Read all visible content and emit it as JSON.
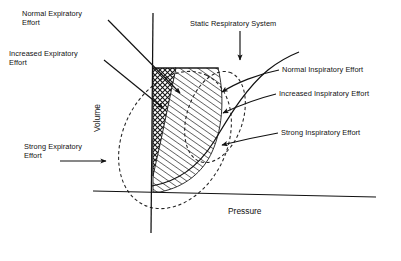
{
  "figure": {
    "axes": {
      "x_label": "Pressure",
      "y_label": "Volume",
      "x_label_pos": {
        "x": 228,
        "y": 206
      },
      "y_label_pos": {
        "x": 92,
        "y": 130
      },
      "origin": {
        "x": 152,
        "y": 193
      },
      "x_axis_start": {
        "x": 93,
        "y": 191
      },
      "x_axis_end": {
        "x": 376,
        "y": 197
      },
      "y_axis_top": {
        "x": 153,
        "y": 13
      },
      "y_axis_bottom": {
        "x": 151,
        "y": 233
      }
    },
    "annotations": [
      {
        "id": "normal-expiratory-effort",
        "label": "Normal Expiratory\nEffort",
        "line1": "Normal Expiratory",
        "line2": "Effort",
        "text_pos": {
          "x": 22,
          "y": 9
        },
        "leader_from": {
          "x": 108,
          "y": 20
        },
        "leader_to": {
          "x": 180,
          "y": 93
        },
        "side": "left"
      },
      {
        "id": "increased-expiratory-effort",
        "label": "Increased Expiratory\nEffort",
        "line1": "Increased Expiratory",
        "line2": "Effort",
        "text_pos": {
          "x": 9,
          "y": 49
        },
        "leader_from": {
          "x": 104,
          "y": 60
        },
        "leader_to": {
          "x": 161,
          "y": 107
        },
        "side": "left"
      },
      {
        "id": "strong-expiratory-effort",
        "label": "Strong Expiratory\nEffort",
        "line1": "Strong Expiratory",
        "line2": "Effort",
        "text_pos": {
          "x": 24,
          "y": 142
        },
        "leader_from": {
          "x": 60,
          "y": 161
        },
        "leader_to": {
          "x": 105,
          "y": 161
        },
        "side": "left"
      },
      {
        "id": "static-respiratory-system",
        "label": "Static Respiratory System",
        "line1": "Static Respiratory System",
        "line2": "",
        "text_pos": {
          "x": 190,
          "y": 19
        },
        "leader_from": {
          "x": 240,
          "y": 31
        },
        "leader_to": {
          "x": 240,
          "y": 59
        },
        "side": "top"
      },
      {
        "id": "normal-inspiratory-effort",
        "label": "Normal Inspiratory Effort",
        "line1": "Normal Inspiratory Effort",
        "line2": "",
        "text_pos": {
          "x": 282,
          "y": 65
        },
        "leader_from": {
          "x": 279,
          "y": 70
        },
        "leader_to": {
          "x": 219,
          "y": 93
        },
        "side": "right"
      },
      {
        "id": "increased-inspiratory-effort",
        "label": "Increased Inspiratory Effort",
        "line1": "Increased Inspiratory Effort",
        "line2": "",
        "text_pos": {
          "x": 279,
          "y": 89
        },
        "leader_from": {
          "x": 276,
          "y": 94
        },
        "leader_to": {
          "x": 220,
          "y": 113
        },
        "side": "right"
      },
      {
        "id": "strong-inspiratory-effort",
        "label": "Strong Inspiratory Effort",
        "line1": "Strong Inspiratory Effort",
        "line2": "",
        "text_pos": {
          "x": 281,
          "y": 128
        },
        "leader_from": {
          "x": 278,
          "y": 133
        },
        "leader_to": {
          "x": 219,
          "y": 145
        },
        "side": "right"
      }
    ],
    "regions": [
      {
        "id": "crosshatched-region",
        "pattern": "crosshatch",
        "description": "Normal tidal breathing zone adjacent to the volume axis"
      },
      {
        "id": "diagonal-hatched-region",
        "pattern": "diagonal-hatch",
        "description": "Increased effort zone right of the crosshatched column"
      }
    ],
    "curves": [
      {
        "id": "static-compliance-curve",
        "style": "solid",
        "description": "Static respiratory system pressure-volume curve"
      },
      {
        "id": "outer-effort-ellipse",
        "style": "dashed",
        "description": "Large dashed ellipse of maximal effort envelope"
      },
      {
        "id": "inner-effort-ellipse",
        "style": "dashed",
        "description": "Small dashed ellipse of intermediate effort envelope"
      }
    ],
    "colors": {
      "ink": "#111111",
      "background": "#ffffff",
      "hatch": "#1a1a1a"
    }
  }
}
